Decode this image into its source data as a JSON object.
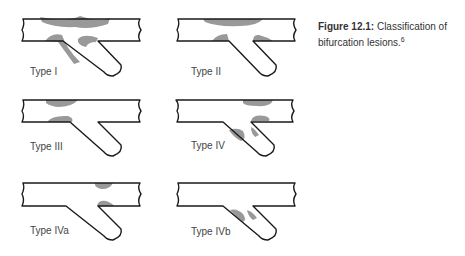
{
  "caption": {
    "figure_label": "Figure 12.1:",
    "text": "Classification of bifurcation lesions.",
    "reference": "6"
  },
  "panels": [
    {
      "label": "Type I"
    },
    {
      "label": "Type II"
    },
    {
      "label": "Type III"
    },
    {
      "label": "Type IV"
    },
    {
      "label": "Type IVa"
    },
    {
      "label": "Type IVb"
    }
  ],
  "colors": {
    "outline": "#1a1a1a",
    "lesion": "#999999"
  }
}
